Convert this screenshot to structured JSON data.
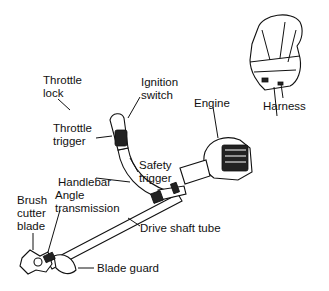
{
  "diagram": {
    "labels": [
      {
        "id": "throttle-lock",
        "text": "Throttle\nlock"
      },
      {
        "id": "ignition-switch",
        "text": "Ignition\nswitch"
      },
      {
        "id": "throttle-trigger",
        "text": "Throttle\ntrigger"
      },
      {
        "id": "handlebar",
        "text": "Handlebar"
      },
      {
        "id": "safety-trigger",
        "text": "Safety\ntrigger"
      },
      {
        "id": "engine",
        "text": "Engine"
      },
      {
        "id": "harness",
        "text": "Harness"
      },
      {
        "id": "brush-cutter-blade",
        "text": "Brush\ncutter\nblade"
      },
      {
        "id": "angle-transmission",
        "text": "Angle\ntransmission"
      },
      {
        "id": "drive-shaft-tube",
        "text": "Drive shaft tube"
      },
      {
        "id": "blade-guard",
        "text": "Blade guard"
      }
    ]
  }
}
